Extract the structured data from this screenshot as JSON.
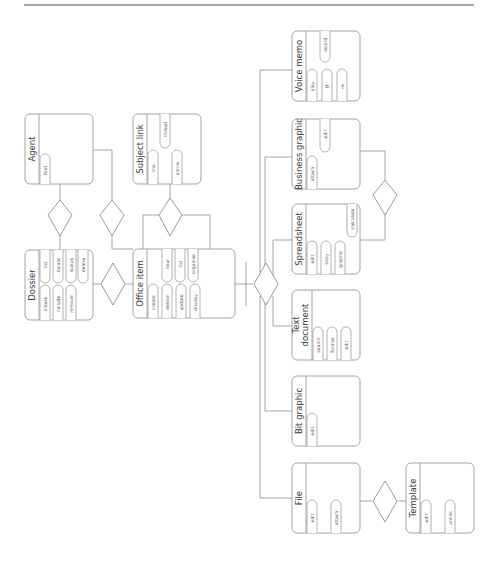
{
  "page": {
    "rule_color": "#8a8a8a",
    "line_color": "#9a9a9a"
  },
  "entities": {
    "agent": {
      "title": [
        "Agent"
      ],
      "ops": [
        "find"
      ]
    },
    "subject_link": {
      "title": [
        "Subject link"
      ],
      "ops": [
        "link",
        "unlink",
        "thread"
      ]
    },
    "dossier": {
      "title": [
        "Dossier"
      ],
      "ops": [
        "create",
        "include",
        "remove",
        "list",
        "locate",
        "status",
        "delete"
      ]
    },
    "office_item": {
      "title": [
        "Office item"
      ],
      "ops": [
        "create",
        "delete",
        "update",
        "display",
        "hour",
        "list",
        "organise"
      ]
    },
    "voice_memo": {
      "title": [
        "Voice memo"
      ],
      "ops": [
        "play",
        "ff",
        "rw",
        "record"
      ]
    },
    "business_graphic": {
      "title": [
        "Business graphic"
      ],
      "ops": [
        "attach",
        "edit"
      ]
    },
    "spreadsheet": {
      "title": [
        "Spreadsheet"
      ],
      "ops": [
        "edit",
        "copy",
        "graphic",
        "calculate"
      ]
    },
    "text_document": {
      "title": [
        "Text",
        "document"
      ],
      "ops": [
        "search",
        "format",
        "edit"
      ]
    },
    "bit_graphic": {
      "title": [
        "Bit graphic"
      ],
      "ops": [
        "edit"
      ]
    },
    "file": {
      "title": [
        "File"
      ],
      "ops": [
        "edit",
        "attach"
      ]
    },
    "template": {
      "title": [
        "Template"
      ],
      "ops": [
        "edit",
        "unlink"
      ]
    }
  },
  "relationships": [
    {
      "name": "agent-dossier",
      "from": "agent",
      "to": "dossier"
    },
    {
      "name": "agent-office-item",
      "from": "agent",
      "to": "office_item"
    },
    {
      "name": "subject-link-office-item",
      "from": "subject_link",
      "to": "office_item"
    },
    {
      "name": "dossier-office-item",
      "from": "dossier",
      "to": "office_item"
    },
    {
      "name": "office-item-subtypes",
      "from": "office_item",
      "to": [
        "voice_memo",
        "business_graphic",
        "spreadsheet",
        "text_document",
        "bit_graphic",
        "file"
      ]
    },
    {
      "name": "business-graphic-spreadsheet",
      "from": "business_graphic",
      "to": "spreadsheet"
    },
    {
      "name": "file-template",
      "from": "file",
      "to": "template"
    }
  ]
}
